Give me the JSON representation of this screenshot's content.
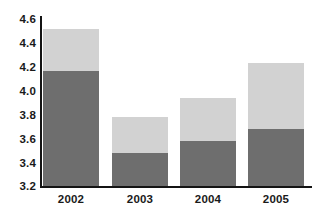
{
  "chart_data": {
    "type": "bar",
    "stacked": true,
    "title": "",
    "subtitle": "",
    "xlabel": "",
    "ylabel": "",
    "categories": [
      "2002",
      "2003",
      "2004",
      "2005"
    ],
    "ylim": [
      3.2,
      4.6
    ],
    "ytick_labels": [
      "4.6",
      "4.4",
      "4.2",
      "4.0",
      "3.8",
      "3.6",
      "3.4",
      "3.2"
    ],
    "ytick_values": [
      4.6,
      4.4,
      4.2,
      4.0,
      3.8,
      3.6,
      3.4,
      3.2
    ],
    "ytick_step": 0.2,
    "grid": false,
    "legend": "none",
    "series": [
      {
        "name": "lower-segment",
        "color": "#6e6e6e",
        "values": [
          4.16,
          3.48,
          3.58,
          3.68
        ]
      },
      {
        "name": "upper-segment",
        "color": "#d2d2d2",
        "values": [
          4.52,
          3.78,
          3.94,
          4.23
        ]
      }
    ],
    "stack_tops": [
      4.52,
      3.78,
      3.94,
      4.23
    ],
    "stack_splits": [
      4.16,
      3.48,
      3.58,
      3.68
    ],
    "colors": {
      "lower": "#6e6e6e",
      "upper": "#d2d2d2",
      "axis": "#141414",
      "text": "#1a1a1a",
      "background": "#ffffff"
    }
  }
}
